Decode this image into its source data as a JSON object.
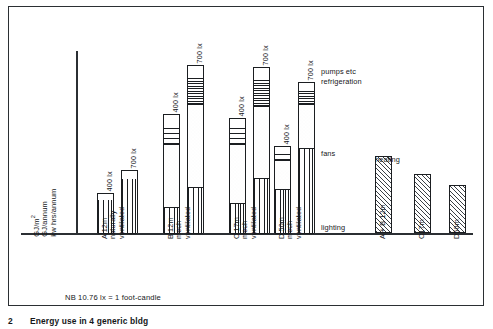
{
  "figure": {
    "caption_number": "2",
    "caption_text": "Energy use in 4 generic bldg",
    "footnote": "NB 10.76 lx = 1 foot-candle"
  },
  "axes": {
    "y_caption_lines": [
      "GJ/m2",
      "GJ/annum",
      "kw hrs/annum"
    ],
    "y_unit_1": "GJ/m",
    "y_unit_1_sup": "2",
    "y_unit_2": "GJ/annum",
    "y_unit_3": "kw hrs/annum"
  },
  "annotations": {
    "pumps": "pumps etc",
    "refrigeration": "refrigeration",
    "fans": "fans",
    "lighting": "lighting",
    "heating": "heating"
  },
  "chart_data": {
    "type": "bar",
    "title": "Energy use in 4 generic bldg",
    "xlabel": "",
    "ylabel": "GJ/m2  GJ/annum  kw hrs/annum",
    "ylim": [
      0,
      100
    ],
    "grid": false,
    "legend_position": "inline-annotations",
    "note": "NB 10.76 lx = 1 foot-candle",
    "stack_order_bottom_to_top": [
      "lighting",
      "fans",
      "refrigeration",
      "pumps etc"
    ],
    "segment_labels": [
      "lighting",
      "fans",
      "refrigeration",
      "pumps etc"
    ],
    "panels": [
      {
        "name": "electricity-stacked",
        "categories": [
          "A 12m naturally ventilated",
          "B 12m mech ventilated",
          "C 17m mech ventilated",
          "D 50m mech ventilated"
        ],
        "sub_categories": [
          "400 lx",
          "700 lx"
        ],
        "bars": [
          {
            "group": "A 12m naturally ventilated",
            "lines": [
              "A 12m",
              "naturally",
              "ventilated"
            ],
            "sub_bars": [
              {
                "label": "400 lx",
                "total": 20,
                "segments": {
                  "lighting": 17,
                  "fans": 0,
                  "refrigeration": 0,
                  "pumps etc": 3
                }
              },
              {
                "label": "700 lx",
                "total": 31,
                "segments": {
                  "lighting": 27,
                  "fans": 0,
                  "refrigeration": 0,
                  "pumps etc": 4
                }
              }
            ]
          },
          {
            "group": "B 12m mech ventilated",
            "lines": [
              "B 12m",
              "mech",
              "ventilated"
            ],
            "sub_bars": [
              {
                "label": "400 lx",
                "total": 59,
                "segments": {
                  "lighting": 13,
                  "fans": 31,
                  "refrigeration": 10,
                  "pumps etc": 5
                }
              },
              {
                "label": "700 lx",
                "total": 83,
                "segments": {
                  "lighting": 23,
                  "fans": 41,
                  "refrigeration": 13,
                  "pumps etc": 6
                }
              }
            ]
          },
          {
            "group": "C 17m mech ventilated",
            "lines": [
              "C 17m",
              "mech",
              "ventilated"
            ],
            "sub_bars": [
              {
                "label": "400 lx",
                "total": 57,
                "segments": {
                  "lighting": 15,
                  "fans": 29,
                  "refrigeration": 9,
                  "pumps etc": 4
                }
              },
              {
                "label": "700 lx",
                "total": 82,
                "segments": {
                  "lighting": 27,
                  "fans": 36,
                  "refrigeration": 13,
                  "pumps etc": 6
                }
              }
            ]
          },
          {
            "group": "D 50m mech ventilated",
            "lines": [
              "D 50m",
              "mech",
              "ventilated"
            ],
            "sub_bars": [
              {
                "label": "400 lx",
                "total": 43,
                "segments": {
                  "lighting": 22,
                  "fans": 14,
                  "refrigeration": 5,
                  "pumps etc": 2
                }
              },
              {
                "label": "700 lx",
                "total": 75,
                "segments": {
                  "lighting": 42,
                  "fans": 22,
                  "refrigeration": 7,
                  "pumps etc": 4
                }
              }
            ]
          }
        ]
      },
      {
        "name": "heating",
        "series_label": "heating",
        "categories": [
          "A + B 12m",
          "C 17m",
          "D 50m"
        ],
        "category_lines": [
          [
            "A + B 12m"
          ],
          [
            "C",
            "17m"
          ],
          [
            "D",
            "50m"
          ]
        ],
        "values": [
          38,
          29,
          24
        ]
      }
    ]
  }
}
